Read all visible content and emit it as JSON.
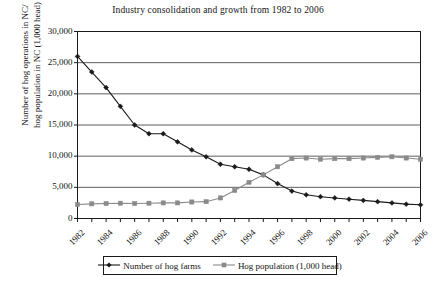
{
  "figure": {
    "background": "#ffffff",
    "ink": "#141414"
  },
  "chart_data": {
    "type": "line",
    "title": "Industry consolidation and growth from 1982 to 2006",
    "xlabel": "",
    "ylabel": "Number of hog operations in NC/ hog population in NC (1,000 head)",
    "ylabel_lines": [
      "Number of hog operations in NC/",
      "hog population in NC (1,000 head)"
    ],
    "ylim": [
      0,
      30000
    ],
    "ytick_values": [
      0,
      5000,
      10000,
      15000,
      20000,
      25000,
      30000
    ],
    "ytick_labels": [
      "0",
      "5,000",
      "10,000",
      "15,000",
      "20,000",
      "25,000",
      "30,000"
    ],
    "x": [
      1982,
      1983,
      1984,
      1985,
      1986,
      1987,
      1988,
      1989,
      1990,
      1991,
      1992,
      1993,
      1994,
      1995,
      1996,
      1997,
      1998,
      1999,
      2000,
      2001,
      2002,
      2003,
      2004,
      2005,
      2006
    ],
    "xtick_labels_shown": [
      "1982",
      "1984",
      "1986",
      "1988",
      "1990",
      "1992",
      "1994",
      "1996",
      "1998",
      "2000",
      "2002",
      "2004",
      "2006"
    ],
    "grid": "horizontal",
    "legend_position": "below-plot",
    "series": [
      {
        "name": "Number of hog farms",
        "color": "#1a1a1a",
        "marker": "diamond",
        "values": [
          26000,
          23500,
          21000,
          18000,
          15000,
          13600,
          13600,
          12300,
          11000,
          9900,
          8700,
          8300,
          7900,
          7000,
          5600,
          4400,
          3800,
          3500,
          3300,
          3100,
          2900,
          2700,
          2500,
          2300,
          2200
        ]
      },
      {
        "name": "Hog population (1,000 head)",
        "color": "#8a8a8a",
        "marker": "square",
        "values": [
          2250,
          2350,
          2400,
          2450,
          2400,
          2450,
          2500,
          2500,
          2650,
          2700,
          3300,
          4500,
          5800,
          7000,
          8300,
          9600,
          9700,
          9500,
          9600,
          9600,
          9700,
          9800,
          9900,
          9700,
          9500
        ]
      }
    ]
  },
  "legend": {
    "items": [
      {
        "label": "Number of hog farms",
        "marker": "diamond",
        "color": "#1a1a1a"
      },
      {
        "label": "Hog population (1,000 head)",
        "marker": "square",
        "color": "#8a8a8a"
      }
    ]
  },
  "bottom_caption": ""
}
